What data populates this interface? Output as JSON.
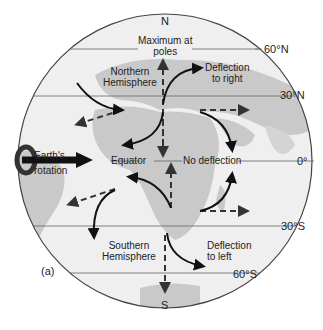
{
  "figure": {
    "panel_label": "(a)",
    "poles": {
      "north": "N",
      "south": "S"
    },
    "latitudes": {
      "n60": "60°N",
      "n30": "30°N",
      "eq": "0°",
      "s30": "30°S",
      "s60": "60°S"
    },
    "labels": {
      "max_poles_1": "Maximum at",
      "max_poles_2": "poles",
      "north_hemi_1": "Northern",
      "north_hemi_2": "Hemisphere",
      "south_hemi_1": "Southern",
      "south_hemi_2": "Hemisphere",
      "defl_right_1": "Deflection",
      "defl_right_2": "to right",
      "defl_left_1": "Deflection",
      "defl_left_2": "to left",
      "no_defl": "No deflection",
      "equator": "Equator",
      "rotation_1": "Earth's",
      "rotation_2": "rotation"
    },
    "colors": {
      "ocean": "#efefef",
      "land": "#c9c9c9",
      "lines": "#555555",
      "arrows": "#111111"
    }
  }
}
